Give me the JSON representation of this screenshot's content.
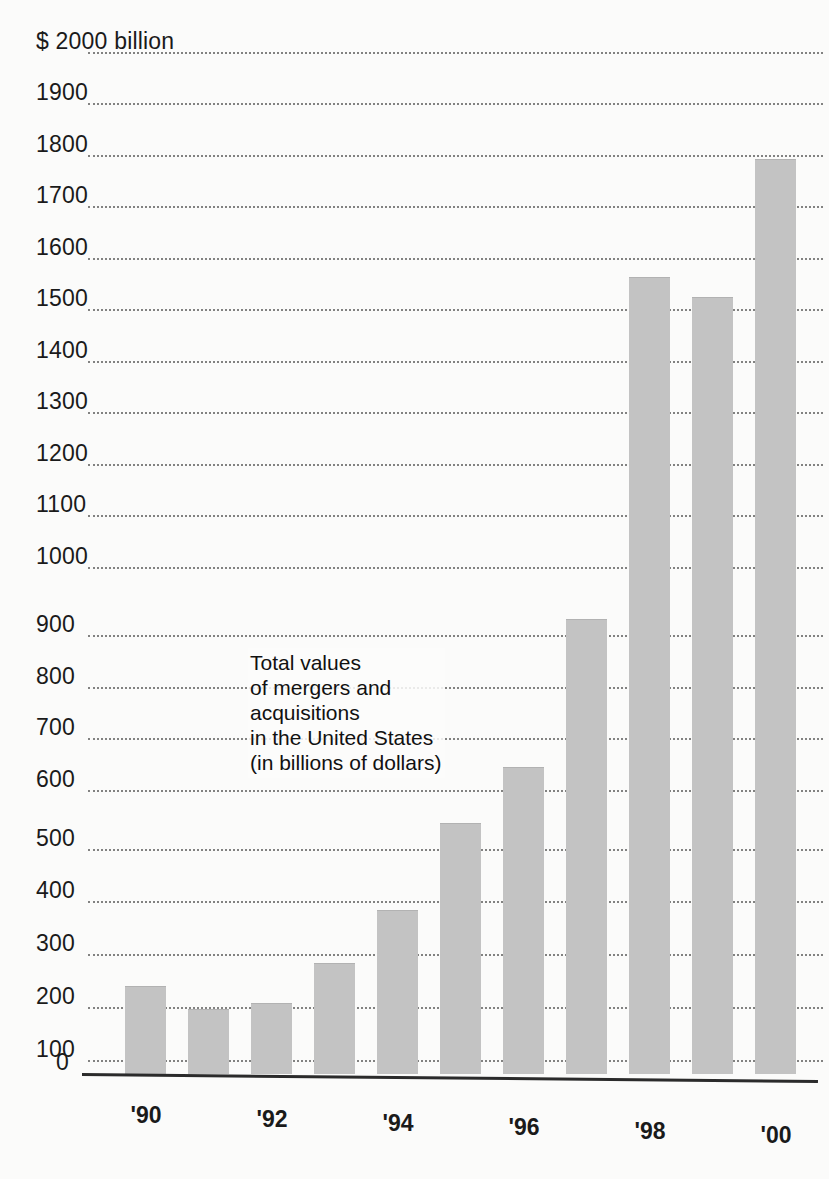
{
  "chart_data": {
    "type": "bar",
    "title": "",
    "annotation_lines": [
      "Total values",
      "of mergers and",
      "acquisitions",
      "in the United States",
      "(in billions of dollars)"
    ],
    "xlabel": "",
    "ylabel": "$ 2000 billion",
    "ylim": [
      0,
      2000
    ],
    "grid": true,
    "legend": "none",
    "unit_note": "$ 2000 billion",
    "categories": [
      "'90",
      "'91",
      "'92",
      "'93",
      "'94",
      "'95",
      "'96",
      "'97",
      "'98",
      "'99",
      "'00"
    ],
    "xtick_labels_visible": [
      "'90",
      "'92",
      "'94",
      "'96",
      "'98",
      "'00"
    ],
    "values": [
      170,
      125,
      137,
      215,
      320,
      490,
      600,
      890,
      1560,
      1520,
      1790
    ],
    "ytick_labels": [
      "$ 2000 billion",
      "1900",
      "1800",
      "1700",
      "1600",
      "1500",
      "1400",
      "1300",
      "1200",
      "1100",
      "1000",
      "900",
      "800",
      "700",
      "600",
      "500",
      "400",
      "300",
      "200",
      "100",
      "0"
    ],
    "ytick_values": [
      2000,
      1900,
      1800,
      1700,
      1600,
      1500,
      1400,
      1300,
      1200,
      1100,
      1000,
      900,
      800,
      700,
      600,
      500,
      400,
      300,
      200,
      100,
      0
    ],
    "colors": {
      "bar_fill": "#c3c3c3",
      "gridline": "#6d6d6d",
      "axis": "#2b2b2b",
      "text": "#1a1a1a",
      "background": "#fbfbfa"
    }
  }
}
